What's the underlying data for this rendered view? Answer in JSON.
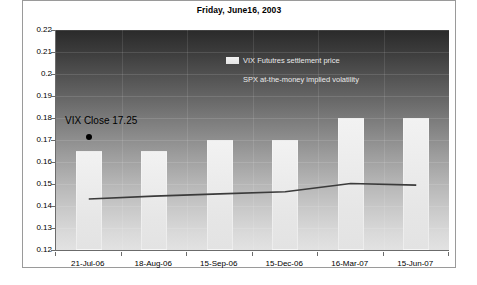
{
  "figure": {
    "title": "Friday, June16, 2003",
    "frame_border_color": "#9a9a9a",
    "background_color": "#ffffff"
  },
  "annotation": {
    "vix_close_label": "VIX Close 17.25",
    "marker_name": "vix-close-marker"
  },
  "legend": {
    "position": "inside-top-center",
    "entries": [
      {
        "label": "VIX Fututres settlement price",
        "type": "bar",
        "color": "#ececec"
      },
      {
        "label": "SPX at-the-money implied volatility",
        "type": "line",
        "color": "#333333"
      }
    ]
  },
  "chart_data": {
    "type": "bar",
    "title": "Friday, June16, 2003",
    "xlabel": "",
    "ylabel": "",
    "ylim": [
      0.12,
      0.22
    ],
    "ytick_step": 0.01,
    "yticks": [
      "0.22",
      "0.21",
      "0.2",
      "0.19",
      "0.18",
      "0.17",
      "0.16",
      "0.15",
      "0.14",
      "0.13",
      "0.12"
    ],
    "ytick_values": [
      0.22,
      0.21,
      0.2,
      0.19,
      0.18,
      0.17,
      0.16,
      0.15,
      0.14,
      0.13,
      0.12
    ],
    "grid": true,
    "categories": [
      "21-Jul-06",
      "18-Aug-06",
      "15-Sep-06",
      "15-Dec-06",
      "16-Mar-07",
      "15-Jun-07"
    ],
    "series": [
      {
        "name": "VIX Fututres settlement price",
        "type": "bar",
        "values": [
          0.165,
          0.165,
          0.17,
          0.17,
          0.18,
          0.18
        ]
      },
      {
        "name": "SPX at-the-money implied volatility",
        "type": "line",
        "values": [
          0.1432,
          0.1445,
          0.1455,
          0.1465,
          0.1502,
          0.1495
        ]
      }
    ],
    "annotations": [
      {
        "text": "VIX Close 17.25",
        "value": 0.1725,
        "category": "21-Jul-06"
      }
    ]
  }
}
